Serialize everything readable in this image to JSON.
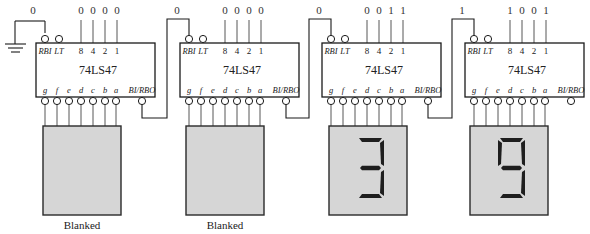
{
  "diagram": {
    "chip_label": "74LS47",
    "input_pin_labels": [
      "8",
      "4",
      "2",
      "1"
    ],
    "control_pin_labels": {
      "rbi": "RBI",
      "lt": "LT",
      "birbo": "BI/RBO"
    },
    "output_pin_labels": [
      "g",
      "f",
      "e",
      "d",
      "c",
      "b",
      "a"
    ],
    "ground_symbol": "ground-icon",
    "stages": [
      {
        "rbi_value": "0",
        "bcd": [
          "0",
          "0",
          "0",
          "0"
        ],
        "digit": "",
        "status": "Blanked",
        "segments_on": []
      },
      {
        "rbi_value": "0",
        "bcd": [
          "0",
          "0",
          "0",
          "0"
        ],
        "digit": "",
        "status": "Blanked",
        "segments_on": []
      },
      {
        "rbi_value": "0",
        "bcd": [
          "0",
          "0",
          "1",
          "1"
        ],
        "digit": "3",
        "status": "",
        "segments_on": [
          "a",
          "b",
          "c",
          "d",
          "g"
        ]
      },
      {
        "rbi_value": "1",
        "bcd": [
          "1",
          "0",
          "0",
          "1"
        ],
        "digit": "9",
        "status": "",
        "segments_on": [
          "a",
          "b",
          "c",
          "d",
          "f",
          "g"
        ]
      }
    ]
  },
  "colors": {
    "display_bg": "#d6d6d6",
    "segment_on": "#1e1e1e",
    "line": "#1a1a1a"
  }
}
